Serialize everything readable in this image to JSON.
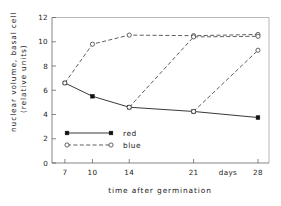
{
  "chart_data": {
    "type": "line",
    "title": "",
    "xlabel": "time  after  germination",
    "xunit": "days",
    "ylabel_line1": "nuclear volume, basal cell",
    "ylabel_line2": "(relative units)",
    "x": [
      7,
      10,
      14,
      21,
      28
    ],
    "xticklabels": [
      "7",
      "10",
      "14",
      "21",
      "28"
    ],
    "xlim": [
      5.6,
      29.2
    ],
    "ylim": [
      0,
      12
    ],
    "yticks": [
      0,
      2,
      4,
      6,
      8,
      10,
      12
    ],
    "yticklabels": [
      "0",
      "2",
      "4",
      "6",
      "8",
      "10",
      "12"
    ],
    "grid": false,
    "legend_position": "inside-lower-left",
    "series": [
      {
        "name": "red",
        "style": "solid",
        "marker": "filled-square",
        "x": [
          7,
          10,
          14,
          21,
          28
        ],
        "values": [
          6.6,
          5.5,
          4.6,
          4.25,
          3.75
        ]
      },
      {
        "name": "blue",
        "style": "dashed",
        "marker": "open-circle",
        "x": [
          7,
          10,
          14,
          21,
          28
        ],
        "values": [
          6.6,
          9.8,
          10.55,
          10.5,
          10.6
        ]
      },
      {
        "name": "blue",
        "style": "dashed",
        "marker": "open-circle",
        "x": [
          14,
          21,
          28
        ],
        "values": [
          4.6,
          10.4,
          10.45
        ]
      },
      {
        "name": "blue",
        "style": "dashed",
        "marker": "open-circle",
        "x": [
          21,
          28
        ],
        "values": [
          4.25,
          9.3
        ]
      }
    ],
    "legend": [
      {
        "label": "red",
        "style": "solid",
        "marker": "filled-square"
      },
      {
        "label": "blue",
        "style": "dashed",
        "marker": "open-circle"
      }
    ]
  },
  "colors": {
    "background": "#ffffff",
    "axis": "#555555",
    "red_series": "#111111",
    "blue_series": "#333333"
  }
}
